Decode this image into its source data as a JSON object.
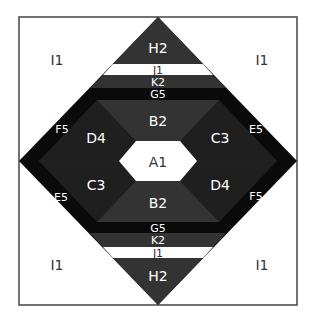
{
  "diagram": {
    "title": "",
    "colors": {
      "I1": "#ffffff",
      "H2": "#333333",
      "J1": "#ffffff",
      "K2": "#333333",
      "G5": "#0a0a0a",
      "F5": "#0a0a0a",
      "E5": "#0a0a0a",
      "D4": "#1f1f1f",
      "C3": "#1f1f1f",
      "B2": "#333333",
      "A1": "#ffffff",
      "border": "#444444",
      "text_dark": "#333333",
      "text_light": "#ffffff"
    },
    "labels": {
      "i1_top_left": "I1",
      "i1_top_right": "I1",
      "i1_bottom_left": "I1",
      "i1_bottom_right": "I1",
      "h2_top": "H2",
      "h2_bottom": "H2",
      "j1_top": "J1",
      "j1_bottom": "J1",
      "k2_top": "K2",
      "k2_bottom": "K2",
      "g5_top": "G5",
      "g5_bottom": "G5",
      "f5_left": "F5",
      "f5_right": "F5",
      "e5_left": "E5",
      "e5_right": "E5",
      "d4_left": "D4",
      "d4_right": "D4",
      "c3_left": "C3",
      "c3_right": "C3",
      "b2_top": "B2",
      "b2_bottom": "B2",
      "a1_center": "A1"
    }
  }
}
